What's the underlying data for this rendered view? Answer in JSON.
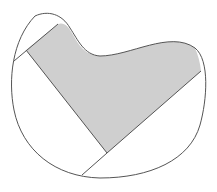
{
  "diagram": {
    "colors": {
      "background": "#ffffff",
      "outline": "#555555",
      "shaded_fill": "#cfcfcf"
    },
    "shapes": {
      "outline_path": "M 35 16 C 48 10 62 14 70 28 C 78 40 84 55 100 56 C 130 56 170 30 195 48 C 210 60 207 100 200 125 C 190 160 150 178 100 178 C 55 177 22 150 14 110 C 8 80 12 40 35 16 Z",
      "shaded_path": "M 26 50 L 58 24 C 64 22 68 26 72 33 C 78 44 84 55 100 56 C 130 56 170 30 195 48 C 198 55 200 62 201 71 L 107 153 Z",
      "segments": [
        {
          "name": "upper-left-chord",
          "x1": 58,
          "y1": 24,
          "x2": 14,
          "y2": 61
        },
        {
          "name": "left-shaded-edge",
          "x1": 26,
          "y1": 50,
          "x2": 107,
          "y2": 153
        },
        {
          "name": "right-shaded-edge",
          "x1": 201,
          "y1": 71,
          "x2": 107,
          "y2": 153
        },
        {
          "name": "bottom-chord",
          "x1": 107,
          "y1": 153,
          "x2": 82,
          "y2": 175
        }
      ]
    }
  }
}
